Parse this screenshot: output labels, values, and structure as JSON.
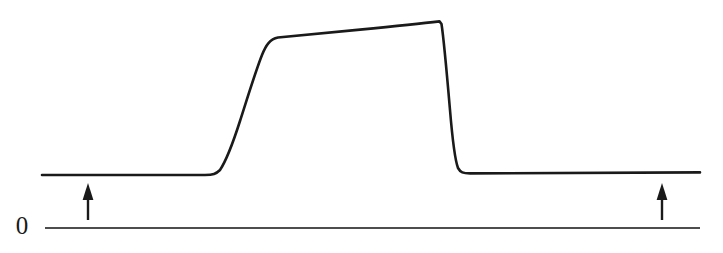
{
  "figure": {
    "type": "scientific-trace",
    "background_color": "#ffffff",
    "trace_color": "#1a1a1a",
    "baseline_color": "#4d4d4d",
    "arrow_color": "#1a1a1a",
    "zero_label": "0"
  },
  "chart_data": {
    "type": "line",
    "title": "",
    "xlabel": "",
    "ylabel": "",
    "grid": false,
    "legend": null,
    "axis_ranges": {
      "x": [
        0,
        723
      ],
      "y": [
        0,
        253
      ]
    },
    "annotations": [
      {
        "name": "zero-level-label",
        "text": "0",
        "x": 20,
        "y": 228
      },
      {
        "name": "left-stimulus-arrow",
        "text": "",
        "x": 88,
        "y_tail": 220,
        "y_head": 183,
        "direction": "up"
      },
      {
        "name": "right-stimulus-arrow",
        "text": "",
        "x": 662,
        "y_tail": 220,
        "y_head": 183,
        "direction": "up"
      }
    ],
    "series": [
      {
        "name": "response-trace",
        "points": [
          [
            42,
            175
          ],
          [
            120,
            175
          ],
          [
            180,
            175
          ],
          [
            212,
            175
          ],
          [
            220,
            172
          ],
          [
            232,
            152
          ],
          [
            250,
            96
          ],
          [
            264,
            56
          ],
          [
            270,
            44
          ],
          [
            278,
            38
          ],
          [
            292,
            36
          ],
          [
            330,
            32
          ],
          [
            380,
            27
          ],
          [
            420,
            23
          ],
          [
            438,
            21
          ],
          [
            443,
            27
          ],
          [
            448,
            60
          ],
          [
            453,
            120
          ],
          [
            456,
            155
          ],
          [
            459,
            168
          ],
          [
            464,
            173
          ],
          [
            480,
            173
          ],
          [
            560,
            173
          ],
          [
            640,
            173
          ],
          [
            700,
            172
          ]
        ]
      },
      {
        "name": "zero-baseline",
        "points": [
          [
            45,
            228
          ],
          [
            700,
            228
          ]
        ]
      }
    ],
    "features": {
      "pre_stimulus_baseline_y": 175,
      "plateau_start_y": 38,
      "plateau_end_y": 21,
      "post_stimulus_baseline_y": 173,
      "rise_start_x": 215,
      "rise_end_x": 278,
      "fall_start_x": 440,
      "fall_end_x": 462
    }
  }
}
